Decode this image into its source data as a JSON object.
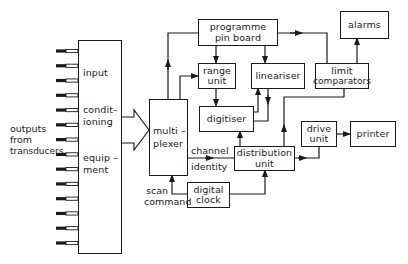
{
  "diagram": {
    "title": "",
    "source_label": [
      "outputs",
      "from",
      "transducers"
    ],
    "input_box": {
      "lines": [
        "input",
        "condit–",
        "ioning",
        "equip –",
        "ment"
      ]
    },
    "input_line_count": 14,
    "blocks": {
      "multiplexer": [
        "multi –",
        "plexer"
      ],
      "programme_pin_board": [
        "programme",
        "pin board"
      ],
      "range_unit": [
        "range",
        "unit"
      ],
      "lineariser": [
        "lineariser"
      ],
      "limit_comparators": [
        "limit",
        "comparators"
      ],
      "alarms": [
        "alarms"
      ],
      "digitiser": [
        "digitiser"
      ],
      "distribution_unit": [
        "distribution",
        "unit"
      ],
      "drive_unit": [
        "drive",
        "unit"
      ],
      "printer": [
        "printer"
      ],
      "digital_clock": [
        "digital",
        "clock"
      ]
    },
    "signal_labels": {
      "channel_identity": [
        "channel",
        "identity"
      ],
      "scan_command": [
        "scan",
        "command"
      ]
    },
    "connections": [
      {
        "from": "input_conditioning_equipment",
        "to": "multiplexer",
        "style": "hollow-arrow"
      },
      {
        "from": "multiplexer",
        "to": "programme_pin_board",
        "style": "arrow"
      },
      {
        "from": "multiplexer",
        "to": "range_unit",
        "style": "arrow"
      },
      {
        "from": "programme_pin_board",
        "to": "range_unit",
        "style": "arrow"
      },
      {
        "from": "programme_pin_board",
        "to": "lineariser",
        "style": "arrow"
      },
      {
        "from": "programme_pin_board",
        "to": "limit_comparators",
        "style": "arrow"
      },
      {
        "from": "range_unit",
        "to": "digitiser",
        "style": "arrow"
      },
      {
        "from": "digitiser",
        "to": "lineariser",
        "style": "arrow"
      },
      {
        "from": "lineariser",
        "to": "digitiser",
        "style": "arrow"
      },
      {
        "from": "limit_comparators",
        "to": "alarms",
        "style": "arrow"
      },
      {
        "from": "limit_comparators",
        "to": "distribution_unit",
        "style": "arrow"
      },
      {
        "from": "distribution_unit",
        "to": "digitiser",
        "style": "arrow"
      },
      {
        "from": "multiplexer",
        "to": "distribution_unit",
        "label": "channel identity",
        "style": "arrow"
      },
      {
        "from": "distribution_unit",
        "to": "drive_unit",
        "style": "arrow"
      },
      {
        "from": "drive_unit",
        "to": "printer",
        "style": "arrow"
      },
      {
        "from": "digital_clock",
        "to": "distribution_unit",
        "style": "arrow"
      },
      {
        "from": "digital_clock",
        "to": "multiplexer",
        "label": "scan command",
        "style": "arrow"
      }
    ],
    "colors": {
      "ink": "#1a1a1a",
      "background": "#ffffff"
    }
  }
}
